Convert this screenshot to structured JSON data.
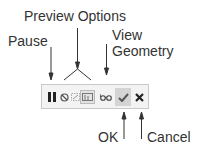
{
  "labels": {
    "pause": "Pause",
    "preview_options": "Preview Options",
    "view_line1": "View",
    "view_line2": "Geometry",
    "ok": "OK",
    "cancel": "Cancel"
  },
  "toolbar": {
    "buttons": [
      {
        "name": "pause",
        "icon": "pause-icon"
      },
      {
        "name": "preview-option-1",
        "icon": "no-preview-icon"
      },
      {
        "name": "preview-option-2",
        "icon": "partial-preview-icon"
      },
      {
        "name": "preview-option-3",
        "icon": "full-preview-icon"
      },
      {
        "name": "view-geometry",
        "icon": "glasses-icon"
      },
      {
        "name": "ok",
        "icon": "checkmark-icon"
      },
      {
        "name": "cancel",
        "icon": "x-icon"
      }
    ]
  },
  "colors": {
    "text": "#333333",
    "toolbar_bg": "#f3f3f3",
    "toolbar_border": "#c9c9c9",
    "ok_bg": "#d4d4d4"
  }
}
